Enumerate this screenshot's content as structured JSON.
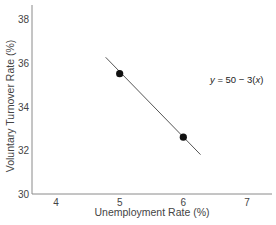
{
  "chart_data": {
    "type": "line",
    "title": "",
    "xlabel": "Unemployment Rate (%)",
    "ylabel": "Voluntary Turnover Rate (%)",
    "xlim": [
      3.5,
      7.5
    ],
    "ylim": [
      30,
      38.5
    ],
    "x_ticks": [
      4,
      5,
      6,
      7
    ],
    "y_ticks": [
      30,
      32,
      34,
      36,
      38
    ],
    "grid": false,
    "legend": null,
    "series": [
      {
        "name": "regression line",
        "type": "line",
        "x": [
          4.78,
          6.27
        ],
        "y": [
          36.25,
          31.8
        ]
      },
      {
        "name": "data points",
        "type": "scatter",
        "x": [
          5,
          6
        ],
        "y": [
          35.5,
          32.6
        ]
      }
    ],
    "annotations": [
      {
        "text_parts": [
          "y",
          " = 50 − 3(",
          "x",
          ")"
        ],
        "x": 6.55,
        "y": 35.3
      }
    ]
  },
  "colors": {
    "axis": "#888888",
    "line": "#555555",
    "point": "#111111",
    "text": "#444444"
  }
}
